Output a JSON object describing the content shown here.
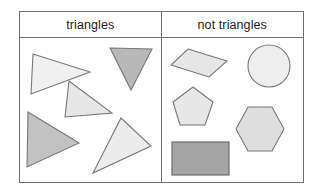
{
  "worksheet": {
    "title": "triangles sorting table",
    "columns": [
      {
        "id": "triangles",
        "label": "triangles"
      },
      {
        "id": "not-triangles",
        "label": "not triangles"
      }
    ],
    "border_color": "#6f6f6f",
    "background": "#ffffff",
    "stroke_color": "#777777",
    "fills": {
      "light": "#eeeeee",
      "medium_light": "#e3e3e3",
      "medium": "#c6c6c6",
      "dark": "#a8a8a8"
    }
  },
  "triangles_cell": {
    "label": "triangles",
    "shapes": [
      {
        "name": "triangle-right-light-top-left",
        "type": "triangle",
        "fill": "#f0f0f0",
        "stroke": "#777777",
        "points": "5,4 62,22 3,44"
      },
      {
        "name": "triangle-down-dark-top-right",
        "type": "triangle",
        "fill": "#b8b8b8",
        "stroke": "#777777",
        "points": "0,0 42,1 21,42"
      },
      {
        "name": "triangle-scalene-light-middle",
        "type": "triangle",
        "fill": "#e7e7e7",
        "stroke": "#777777",
        "points": "5,0 1,36 48,32"
      },
      {
        "name": "triangle-right-medium-bottom-left",
        "type": "triangle",
        "fill": "#c2c2c2",
        "stroke": "#777777",
        "points": "2,2 53,33 1,57"
      },
      {
        "name": "triangle-large-light-bottom-right",
        "type": "triangle",
        "fill": "#ececec",
        "stroke": "#777777",
        "points": "29,2 59,30 1,57"
      }
    ]
  },
  "not_triangles_cell": {
    "label": "not triangles",
    "shapes": [
      {
        "name": "rhombus",
        "type": "rhombus",
        "fill": "#e6e6e6",
        "stroke": "#777777",
        "points": "18,1 57,13 39,29 1,17"
      },
      {
        "name": "circle",
        "type": "circle",
        "fill": "#eeeeee",
        "stroke": "#777777",
        "cx": 22,
        "cy": 22,
        "r": 21
      },
      {
        "name": "pentagon",
        "type": "pentagon",
        "fill": "#e7e7e7",
        "stroke": "#777777",
        "points": "21,1 41,16 33,39 8,39 1,16"
      },
      {
        "name": "hexagon",
        "type": "hexagon",
        "fill": "#dedede",
        "stroke": "#777777",
        "points": "14,1 38,1 50,23 38,45 14,45 2,23"
      },
      {
        "name": "rectangle",
        "type": "rectangle",
        "fill": "#a5a5a5",
        "stroke": "#6b6b6b",
        "width": 57,
        "height": 33
      }
    ]
  }
}
